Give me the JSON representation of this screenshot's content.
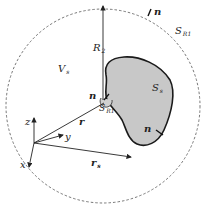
{
  "diagram": {
    "colors": {
      "background": "#ffffff",
      "line": "#222222",
      "blob_fill": "#c8c8c8",
      "blob_stroke": "#1a1a1a",
      "dashed_circle": "#555555"
    },
    "labels": {
      "R": "R",
      "R_sub": "2",
      "V": "V",
      "V_sub": "s",
      "S_outer": "S",
      "S_outer_sub": "R1",
      "S_inner": "S",
      "S_inner_sub": "s",
      "S_small": "S",
      "S_small_sub": "R1",
      "n_top": "n",
      "n_left": "n",
      "n_right": "n",
      "r": "r",
      "r_s": "r",
      "r_s_sub": "s",
      "axis_x": "x",
      "axis_y": "y",
      "axis_z": "z"
    }
  }
}
